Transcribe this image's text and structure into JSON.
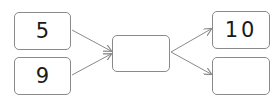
{
  "diagram": {
    "inputs": [
      {
        "value": "5"
      },
      {
        "value": "9"
      }
    ],
    "middle": {
      "value": ""
    },
    "outputs": [
      {
        "value": "10"
      },
      {
        "value": ""
      }
    ],
    "colors": {
      "border": "#8a8a8a",
      "arrow": "#8a8a8a",
      "text": "#1a1a1a"
    }
  }
}
